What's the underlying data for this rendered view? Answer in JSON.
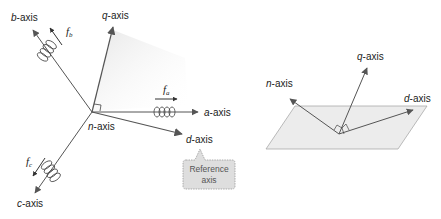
{
  "left_diagram": {
    "axes": {
      "b": {
        "prefix": "b",
        "suffix": "-axis"
      },
      "q": {
        "prefix": "q",
        "suffix": "-axis"
      },
      "a": {
        "prefix": "a",
        "suffix": "-axis"
      },
      "d": {
        "prefix": "d",
        "suffix": "-axis"
      },
      "n": {
        "prefix": "n",
        "suffix": "-axis"
      },
      "c": {
        "prefix": "c",
        "suffix": "-axis"
      }
    },
    "forces": {
      "fa": {
        "symbol": "f",
        "sub": "a"
      },
      "fb": {
        "symbol": "f",
        "sub": "b"
      },
      "fc": {
        "symbol": "f",
        "sub": "c"
      }
    },
    "callout": {
      "line1": "Reference",
      "line2": "axis"
    }
  },
  "right_diagram": {
    "axes": {
      "q": {
        "prefix": "q",
        "suffix": "-axis"
      },
      "n": {
        "prefix": "n",
        "suffix": "-axis"
      },
      "d": {
        "prefix": "d",
        "suffix": "-axis"
      }
    }
  },
  "colors": {
    "line": "#555555",
    "arrow": "#555555",
    "plane_fill": "#ececec",
    "callout_fill": "#dcdcdc"
  }
}
